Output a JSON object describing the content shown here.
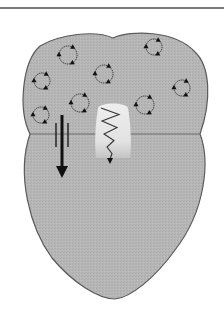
{
  "diagram": {
    "type": "schematic",
    "colors": {
      "background": "#ffffff",
      "top_rule": "#7a7a7a",
      "body_fill": "#b4b4b4",
      "body_stroke": "#5a5a5a",
      "boundary_line": "#6a6a6a",
      "plume_fill": "#e6e6e6",
      "ink": "#111111"
    },
    "boundary_y": 134,
    "rotating_circles": [
      {
        "cx": 68,
        "cy": 55,
        "r": 9
      },
      {
        "cx": 154,
        "cy": 47,
        "r": 8
      },
      {
        "cx": 42,
        "cy": 81,
        "r": 8
      },
      {
        "cx": 104,
        "cy": 74,
        "r": 9
      },
      {
        "cx": 182,
        "cy": 88,
        "r": 8
      },
      {
        "cx": 80,
        "cy": 103,
        "r": 9
      },
      {
        "cx": 145,
        "cy": 105,
        "r": 9
      },
      {
        "cx": 41,
        "cy": 115,
        "r": 8
      }
    ],
    "down_arrow": {
      "x": 62,
      "y_start": 115,
      "y_end": 178,
      "side_bars": [
        [
          56,
          123,
          56,
          147
        ],
        [
          68,
          123,
          68,
          147
        ]
      ]
    },
    "wavy_signal": {
      "x_center": 110,
      "y_start": 108,
      "y_end": 164,
      "plume": {
        "x": 96,
        "y": 104,
        "w": 34,
        "h": 56
      }
    }
  }
}
